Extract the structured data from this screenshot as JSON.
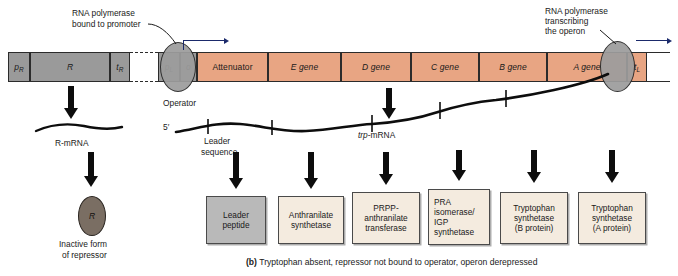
{
  "figure": {
    "caption_marker": "(b)",
    "caption_text": "Tryptophan absent, repressor not bound to operator, operon derepressed"
  },
  "annotations": {
    "polymerase_bound": "RNA polymerase\nbound to promoter",
    "polymerase_bound_line1": "RNA polymerase",
    "polymerase_bound_line2": "bound to promoter",
    "polymerase_transcribing_line1": "RNA polymerase",
    "polymerase_transcribing_line2": "transcribing",
    "polymerase_transcribing_line3": "the operon",
    "operator_label": "Operator",
    "five_prime": "5′",
    "leader_sequence_line1": "Leader",
    "leader_sequence_line2": "sequence",
    "trp_mrna_italic": "trp",
    "trp_mrna_rest": "-mRNA",
    "r_mrna": "R-mRNA",
    "repressor_symbol": "R",
    "inactive_line1": "Inactive form",
    "inactive_line2": "of repressor"
  },
  "dna": {
    "segments": [
      {
        "id": "promoter-r",
        "label": "p",
        "subscript": "R",
        "italic_label": true,
        "fill": "gray",
        "x": 8,
        "w": 22
      },
      {
        "id": "r-gene",
        "label": "R",
        "subscript": "",
        "italic_label": true,
        "fill": "gray",
        "x": 30,
        "w": 80
      },
      {
        "id": "terminator-r",
        "label": "t",
        "subscript": "R",
        "italic_label": true,
        "fill": "gray",
        "x": 110,
        "w": 20
      },
      {
        "id": "spacer",
        "label": "",
        "subscript": "",
        "italic_label": false,
        "fill": "blank",
        "x": 130,
        "w": 28
      },
      {
        "id": "promoter-l",
        "label": "p",
        "subscript": "L",
        "italic_label": true,
        "fill": "gray",
        "x": 158,
        "w": 22
      },
      {
        "id": "operator",
        "label": "o",
        "subscript": "",
        "italic_label": true,
        "fill": "gray",
        "x": 180,
        "w": 17
      },
      {
        "id": "attenuator",
        "label": "Attenuator",
        "subscript": "",
        "italic_label": false,
        "fill": "peach",
        "x": 197,
        "w": 71
      },
      {
        "id": "e-gene",
        "label": "E gene",
        "subscript": "",
        "italic_label": false,
        "fill": "peach",
        "x": 268,
        "w": 73
      },
      {
        "id": "d-gene",
        "label": "D gene",
        "subscript": "",
        "italic_label": false,
        "fill": "peach",
        "x": 341,
        "w": 70
      },
      {
        "id": "c-gene",
        "label": "C gene",
        "subscript": "",
        "italic_label": false,
        "fill": "peach",
        "x": 411,
        "w": 68
      },
      {
        "id": "b-gene",
        "label": "B gene",
        "subscript": "",
        "italic_label": false,
        "fill": "peach",
        "x": 479,
        "w": 68
      },
      {
        "id": "a-gene",
        "label": "A gene",
        "subscript": "",
        "italic_label": false,
        "fill": "peach",
        "x": 547,
        "w": 80
      },
      {
        "id": "terminator-l",
        "label": "t",
        "subscript": "L",
        "italic_label": true,
        "fill": "peach",
        "x": 627,
        "w": 20
      }
    ]
  },
  "products": [
    {
      "id": "leader-peptide",
      "lines": [
        "Leader",
        "peptide"
      ],
      "style": "gray",
      "x": 206,
      "y": 196,
      "w": 60,
      "h": 48
    },
    {
      "id": "anthranilate-synthetase",
      "lines": [
        "Anthranilate",
        "synthetase"
      ],
      "style": "cream",
      "x": 278,
      "y": 196,
      "w": 66,
      "h": 48
    },
    {
      "id": "prpp-anthranilate-transferase",
      "lines": [
        "PRPP-",
        "anthranilate",
        "transferase"
      ],
      "style": "cream",
      "x": 352,
      "y": 192,
      "w": 68,
      "h": 52
    },
    {
      "id": "pra-isomerase-igp-synthetase",
      "lines": [
        "PRA",
        "isomerase/",
        "IGP",
        "synthetase"
      ],
      "style": "cream",
      "x": 428,
      "y": 189,
      "w": 62,
      "h": 56
    },
    {
      "id": "tryptophan-synthetase-b",
      "lines": [
        "Tryptophan",
        "synthetase",
        "(B protein)"
      ],
      "style": "cream",
      "x": 500,
      "y": 192,
      "w": 68,
      "h": 52
    },
    {
      "id": "tryptophan-synthetase-a",
      "lines": [
        "Tryptophan",
        "synthetase",
        "(A protein)"
      ],
      "style": "cream",
      "x": 578,
      "y": 192,
      "w": 68,
      "h": 52
    }
  ],
  "colors": {
    "gene_fill": "#e8a583",
    "regulatory_fill": "#9a9a9a",
    "polymerase_fill": "#9d9d9d",
    "repressor_fill": "#7a6e63",
    "leader_box_fill": "#b9b9b9",
    "product_box_fill": "#f4ebdf",
    "outline": "#2b2b2b",
    "arrow_accent": "#1b2a6b"
  }
}
